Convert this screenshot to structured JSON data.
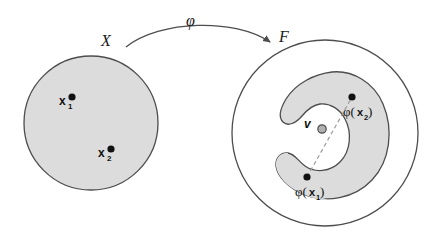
{
  "figure": {
    "type": "diagram",
    "title_text": "",
    "background_color": "#ffffff",
    "stroke_color": "#4d4d4d",
    "region_fill": "#dcdcdc",
    "point_color": "#111111",
    "dashed_color": "#9a9a9a",
    "v_marker_fill": "#b0b0b0"
  },
  "input_space": {
    "label": "X",
    "shape": "circle",
    "center": [
      91,
      123
    ],
    "radius": 67,
    "points": [
      {
        "label": "x",
        "subscript": "1",
        "dot": [
          72,
          97
        ]
      },
      {
        "label": "x",
        "subscript": "2",
        "dot": [
          111,
          149
        ]
      }
    ]
  },
  "feature_space": {
    "label": "F",
    "shape": "circle",
    "center": [
      325,
      133
    ],
    "radius": 93,
    "region_name": "feature-manifold",
    "points": [
      {
        "label": "φ(",
        "bold": "x",
        "subscript": "1",
        "close": ")",
        "dot": [
          307,
          177
        ],
        "text_pos": [
          300,
          195
        ]
      },
      {
        "label": "φ(",
        "bold": "x",
        "subscript": "2",
        "close": ")",
        "dot": [
          352,
          97
        ],
        "text_pos": [
          348,
          115
        ]
      }
    ],
    "mean_vector": {
      "label": "v",
      "dot": [
        322,
        128
      ],
      "text_pos": [
        306,
        125
      ]
    },
    "dashed_segment": {
      "from": [
        307,
        177
      ],
      "to": [
        352,
        97
      ]
    }
  },
  "mapping": {
    "label": "φ",
    "label_pos": [
      191,
      24
    ],
    "arrow_from": [
      126,
      47
    ],
    "arrow_to": [
      272,
      44
    ],
    "arrow_name": "phi-map-arrow"
  }
}
